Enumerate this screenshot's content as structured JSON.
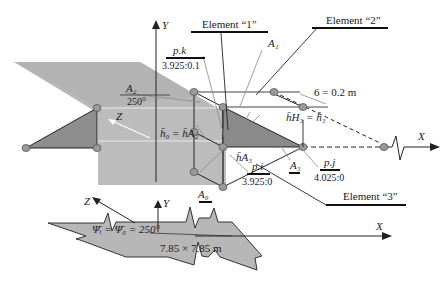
{
  "diagram": {
    "axes": {
      "main_y": "Y",
      "main_x": "X",
      "main_z": "Z",
      "bottom_y": "Y",
      "bottom_x": "X",
      "bottom_z": "Z"
    },
    "elements": {
      "element1": "Element “1”",
      "element2": "Element “2”",
      "element3": "Element “3”"
    },
    "points": {
      "pk_label": "p.k",
      "pk_value": "3.925:0.1",
      "pi_label": "p.i",
      "pi_value": "3.925:0",
      "pj_label": "p.j",
      "pj_value": "4.025:0"
    },
    "areas": {
      "a0": "A₀",
      "a1": "A₁",
      "a2": "A₂",
      "a2_angle": "250°",
      "a3": "A₃"
    },
    "annotations": {
      "thickness": "6 = 0.2 m",
      "h0_eq": "h̄₀ = h̄A₂",
      "hh3_eq": "h̄H₃ = h̄₃",
      "ha3": "h̄A₃",
      "psi_eq": "Ψ̄ᵢ = Ψ̄₀ = 250°",
      "plate_size": "7.85 × 7.85 m"
    },
    "colors": {
      "plane_fill": "#b8b8b8",
      "triangle_fill": "#8a8a8a",
      "node_fill": "#9a9a9a",
      "line": "#222222",
      "leader": "#888888"
    }
  }
}
